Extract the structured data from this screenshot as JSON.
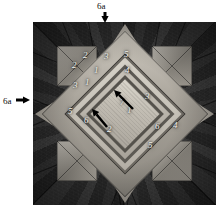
{
  "figure": {
    "caption_present": false,
    "background_color": "#ffffff",
    "plate": {
      "description": "grayscale photograph of a folded eight-pointed fabric star with numbered fold-layer annotations",
      "dark_field_color": "#2b2b2b",
      "star_light_color": "#b0aba2"
    },
    "annotation_color": "#f2f2ee",
    "arrow_color": "#000000"
  },
  "callouts": [
    {
      "name": "top-callout",
      "label": "6a",
      "direction": "down",
      "label_x": 97,
      "label_y": 2,
      "arrow_x": 105,
      "arrow_y": 12
    },
    {
      "name": "left-callout",
      "label": "6a",
      "direction": "right",
      "label_x": 3,
      "label_y": 97,
      "arrow_x": 16,
      "arrow_y": 100
    }
  ],
  "layer_numbers": [
    {
      "id": "n-2a",
      "text": "2",
      "x": 39,
      "y": 39
    },
    {
      "id": "n-2b",
      "text": "2",
      "x": 50,
      "y": 29
    },
    {
      "id": "n-3a",
      "text": "3",
      "x": 71,
      "y": 30
    },
    {
      "id": "n-5a",
      "text": "5",
      "x": 91,
      "y": 28
    },
    {
      "id": "n-1a",
      "text": "1",
      "x": 61,
      "y": 44
    },
    {
      "id": "n-4a",
      "text": "4",
      "x": 92,
      "y": 44
    },
    {
      "id": "n-1b",
      "text": "1",
      "x": 52,
      "y": 56
    },
    {
      "id": "n-3b",
      "text": "3",
      "x": 40,
      "y": 59
    },
    {
      "id": "n-5b",
      "text": "5",
      "x": 35,
      "y": 85
    },
    {
      "id": "n-6a",
      "text": "6",
      "x": 51,
      "y": 94
    },
    {
      "id": "n-7a",
      "text": "7",
      "x": 87,
      "y": 76
    },
    {
      "id": "n-1c",
      "text": "1",
      "x": 94,
      "y": 84
    },
    {
      "id": "n-3c",
      "text": "3",
      "x": 112,
      "y": 70
    },
    {
      "id": "n-2c",
      "text": "2",
      "x": 74,
      "y": 103
    },
    {
      "id": "n-6b",
      "text": "6",
      "x": 122,
      "y": 100
    },
    {
      "id": "n-4b",
      "text": "4",
      "x": 140,
      "y": 99
    },
    {
      "id": "n-5c",
      "text": "5",
      "x": 115,
      "y": 119
    }
  ],
  "inner_arrows": [
    {
      "id": "inner-arrow-upper",
      "tail_x": 133,
      "tail_y": 109,
      "tip_x": 114,
      "tip_y": 90
    },
    {
      "id": "inner-arrow-lower",
      "tail_x": 107,
      "tail_y": 127,
      "tip_x": 92,
      "tip_y": 109
    }
  ]
}
